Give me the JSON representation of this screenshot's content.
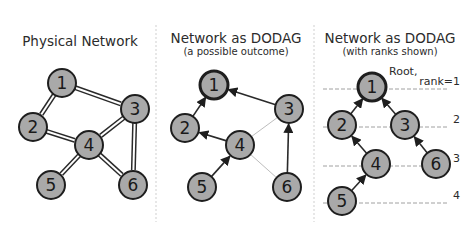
{
  "colors": {
    "node_fill": "#a9a9a9",
    "node_stroke": "#1e1e1e",
    "edge": "#2a2a2a",
    "faint_edge": "#bdbdbd",
    "rank_line": "#a0a0a0"
  },
  "panels": [
    {
      "title": "Physical Network",
      "subtitle": "",
      "nodes": [
        {
          "id": "1",
          "x": 62,
          "y": 83
        },
        {
          "id": "2",
          "x": 33,
          "y": 127
        },
        {
          "id": "3",
          "x": 135,
          "y": 109
        },
        {
          "id": "4",
          "x": 89,
          "y": 145
        },
        {
          "id": "5",
          "x": 51,
          "y": 185
        },
        {
          "id": "6",
          "x": 133,
          "y": 185
        }
      ],
      "edges": [
        {
          "from": "1",
          "to": "2",
          "style": "double"
        },
        {
          "from": "1",
          "to": "3",
          "style": "double"
        },
        {
          "from": "2",
          "to": "4",
          "style": "double"
        },
        {
          "from": "3",
          "to": "4",
          "style": "double"
        },
        {
          "from": "3",
          "to": "6",
          "style": "double"
        },
        {
          "from": "4",
          "to": "5",
          "style": "double"
        },
        {
          "from": "4",
          "to": "6",
          "style": "double"
        }
      ]
    },
    {
      "title": "Network as DODAG",
      "subtitle": "(a possible outcome)",
      "nodes": [
        {
          "id": "1",
          "x": 214,
          "y": 85,
          "root": true
        },
        {
          "id": "2",
          "x": 185,
          "y": 128
        },
        {
          "id": "3",
          "x": 289,
          "y": 109
        },
        {
          "id": "4",
          "x": 240,
          "y": 145
        },
        {
          "id": "5",
          "x": 202,
          "y": 187
        },
        {
          "id": "6",
          "x": 287,
          "y": 187
        }
      ],
      "edges": [
        {
          "from": "2",
          "to": "1",
          "style": "arrow"
        },
        {
          "from": "3",
          "to": "1",
          "style": "arrow"
        },
        {
          "from": "4",
          "to": "2",
          "style": "arrow"
        },
        {
          "from": "5",
          "to": "4",
          "style": "arrow"
        },
        {
          "from": "6",
          "to": "3",
          "style": "arrow"
        },
        {
          "from": "4",
          "to": "3",
          "style": "faint"
        },
        {
          "from": "4",
          "to": "6",
          "style": "faint"
        }
      ]
    },
    {
      "title": "Network as DODAG",
      "subtitle": "(with ranks shown)",
      "root_label": "Root,",
      "nodes": [
        {
          "id": "1",
          "x": 372,
          "y": 87,
          "root": true
        },
        {
          "id": "2",
          "x": 342,
          "y": 125
        },
        {
          "id": "3",
          "x": 405,
          "y": 125
        },
        {
          "id": "4",
          "x": 376,
          "y": 164
        },
        {
          "id": "5",
          "x": 342,
          "y": 201
        },
        {
          "id": "6",
          "x": 436,
          "y": 164
        }
      ],
      "edges": [
        {
          "from": "2",
          "to": "1",
          "style": "arrow"
        },
        {
          "from": "3",
          "to": "1",
          "style": "arrow"
        },
        {
          "from": "4",
          "to": "2",
          "style": "arrow"
        },
        {
          "from": "5",
          "to": "4",
          "style": "arrow"
        },
        {
          "from": "6",
          "to": "3",
          "style": "arrow"
        }
      ],
      "ranks": [
        {
          "label": "rank=1",
          "y": 87
        },
        {
          "label": "2",
          "y": 125
        },
        {
          "label": "3",
          "y": 164
        },
        {
          "label": "4",
          "y": 201
        }
      ]
    }
  ]
}
